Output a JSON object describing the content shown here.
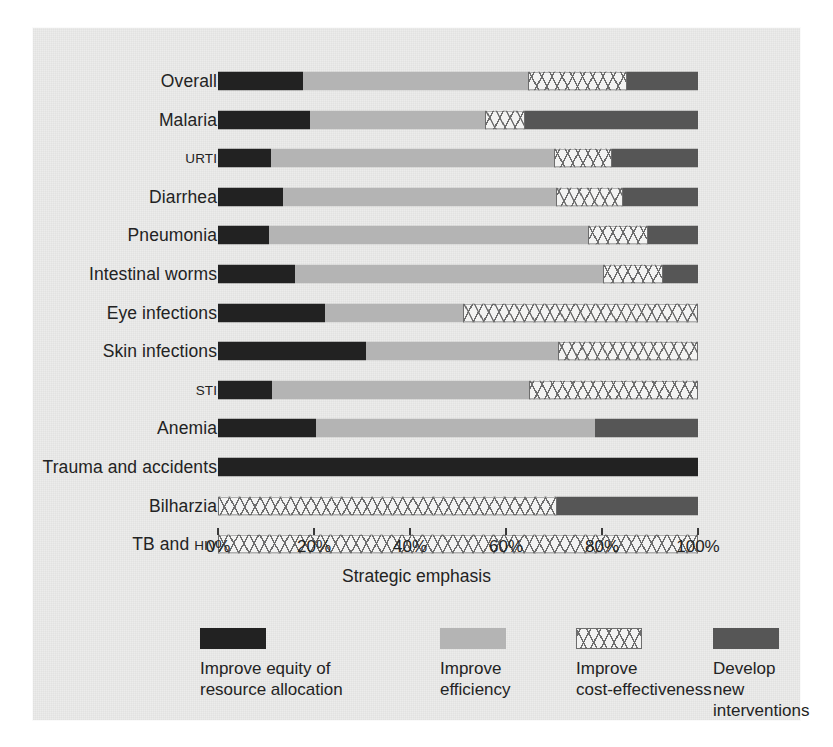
{
  "chart_data": {
    "type": "bar",
    "orientation": "horizontal",
    "stacked": true,
    "stack_percent": true,
    "title": "",
    "xlabel": "Strategic emphasis",
    "ylabel": "",
    "xlim": [
      0,
      100
    ],
    "xticks": [
      0,
      20,
      40,
      60,
      80,
      100
    ],
    "xticklabels": [
      "0%",
      "20%",
      "40%",
      "60%",
      "80%",
      "100%"
    ],
    "grid": false,
    "legend_position": "bottom",
    "categories": [
      "Overall",
      "Malaria",
      "URTI",
      "Diarrhea",
      "Pneumonia",
      "Intestinal worms",
      "Eye infections",
      "Skin infections",
      "STI",
      "Anemia",
      "Trauma and accidents",
      "Bilharzia",
      "TB and HIV"
    ],
    "series": [
      {
        "name": "Improve equity of resource allocation",
        "color": "#222222",
        "values": [
          17.7,
          19.2,
          11.0,
          13.5,
          10.6,
          16.0,
          22.3,
          30.8,
          11.2,
          20.4,
          100.0,
          0.0,
          0.0
        ]
      },
      {
        "name": "Improve efficiency",
        "color": "#b4b4b4",
        "values": [
          46.9,
          36.4,
          59.0,
          56.9,
          66.5,
          64.2,
          28.7,
          40.0,
          53.6,
          58.1,
          0.0,
          0.0,
          0.0
        ]
      },
      {
        "name": "Improve cost-effectiveness",
        "color": "#f3f3f2",
        "pattern": "crosshatch",
        "values": [
          20.6,
          8.4,
          12.0,
          14.0,
          12.5,
          12.5,
          49.0,
          29.2,
          35.2,
          0.0,
          0.0,
          70.6,
          100.0
        ]
      },
      {
        "name": "Develop new interventions",
        "color": "#565656",
        "values": [
          14.8,
          36.0,
          18.0,
          15.6,
          10.4,
          7.3,
          0.0,
          0.0,
          0.0,
          21.5,
          0.0,
          29.4,
          0.0
        ]
      }
    ]
  },
  "axis": {
    "title": "Strategic emphasis",
    "ticks": [
      {
        "value": 0,
        "label": "0%"
      },
      {
        "value": 20,
        "label": "20%"
      },
      {
        "value": 40,
        "label": "40%"
      },
      {
        "value": 60,
        "label": "60%"
      },
      {
        "value": 80,
        "label": "80%"
      },
      {
        "value": 100,
        "label": "100%"
      }
    ]
  },
  "rows": [
    {
      "label": "Overall",
      "style": "normal"
    },
    {
      "label": "Malaria",
      "style": "normal"
    },
    {
      "label": "URTI",
      "style": "small"
    },
    {
      "label": "Diarrhea",
      "style": "normal"
    },
    {
      "label": "Pneumonia",
      "style": "normal"
    },
    {
      "label": "Intestinal worms",
      "style": "normal"
    },
    {
      "label": "Eye infections",
      "style": "normal"
    },
    {
      "label": "Skin infections",
      "style": "normal"
    },
    {
      "label": "STI",
      "style": "small"
    },
    {
      "label": "Anemia",
      "style": "normal"
    },
    {
      "label": "Trauma and accidents",
      "style": "normal"
    },
    {
      "label": "Bilharzia",
      "style": "normal"
    },
    {
      "label": "TB and HIV",
      "style": "mixed",
      "main": "TB and ",
      "sm": "HIV"
    }
  ],
  "legend": {
    "items": [
      {
        "key": "equity",
        "label": "Improve equity of\nresource allocation",
        "color": "#222222"
      },
      {
        "key": "efficiency",
        "label": "Improve\nefficiency",
        "color": "#b4b4b4"
      },
      {
        "key": "costeff",
        "label": "Improve\ncost-effectiveness",
        "color": "#f3f3f2"
      },
      {
        "key": "newint",
        "label": "Develop new\ninterventions",
        "color": "#565656"
      }
    ]
  },
  "colors": {
    "panel_background": "#ececeb",
    "page_background": "#ffffff",
    "text": "#232323"
  }
}
